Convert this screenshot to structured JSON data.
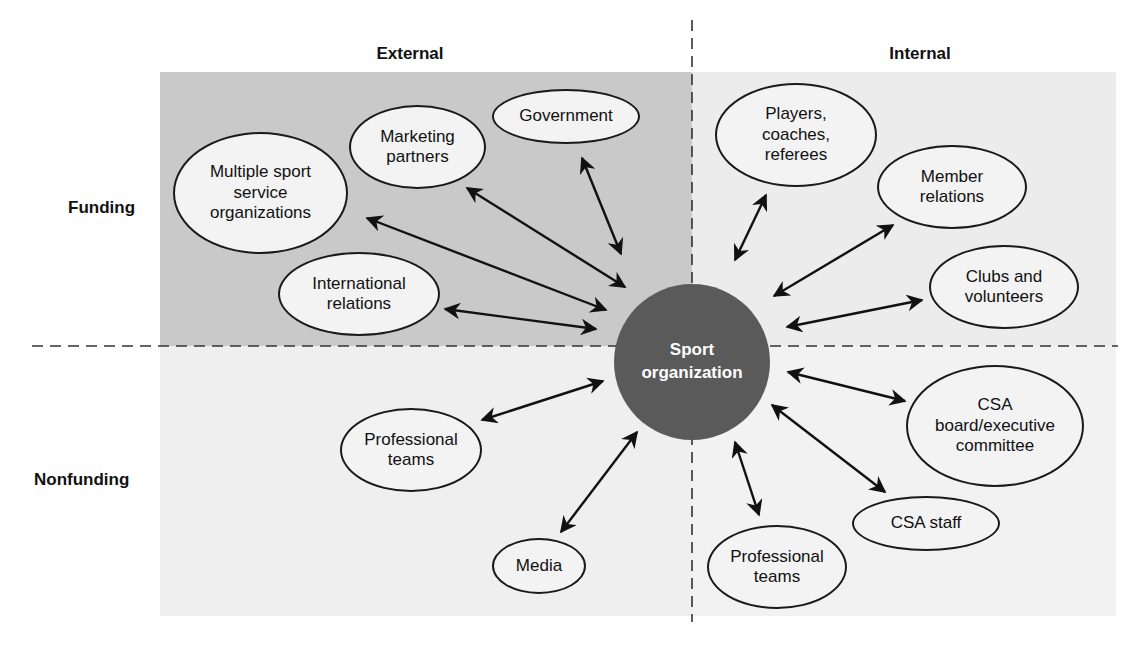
{
  "diagram": {
    "columns": {
      "external": "External",
      "internal": "Internal"
    },
    "rows": {
      "funding": "Funding",
      "nonfunding": "Nonfunding"
    },
    "center": {
      "label": "Sport\norganization",
      "color": "#5a5a5a"
    },
    "quadrant_colors": {
      "external_funding": "#c9c9c9",
      "internal_funding": "#ececec",
      "external_nonfunding": "#efefef",
      "internal_nonfunding": "#f2f2f2"
    },
    "external_funding": [
      {
        "id": "multiple-sport-service-organizations",
        "label": "Multiple sport\nservice\norganizations"
      },
      {
        "id": "marketing-partners",
        "label": "Marketing\npartners"
      },
      {
        "id": "government",
        "label": "Government"
      },
      {
        "id": "international-relations",
        "label": "International\nrelations"
      }
    ],
    "internal_funding": [
      {
        "id": "players-coaches-referees",
        "label": "Players,\ncoaches,\nreferees"
      },
      {
        "id": "member-relations",
        "label": "Member\nrelations"
      },
      {
        "id": "clubs-and-volunteers",
        "label": "Clubs and\nvolunteers"
      }
    ],
    "external_nonfunding": [
      {
        "id": "professional-teams-external",
        "label": "Professional\nteams"
      },
      {
        "id": "media",
        "label": "Media"
      }
    ],
    "internal_nonfunding": [
      {
        "id": "csa-board-executive-committee",
        "label": "CSA\nboard/executive\ncommittee"
      },
      {
        "id": "csa-staff",
        "label": "CSA staff"
      },
      {
        "id": "professional-teams-internal",
        "label": "Professional\nteams"
      }
    ]
  }
}
